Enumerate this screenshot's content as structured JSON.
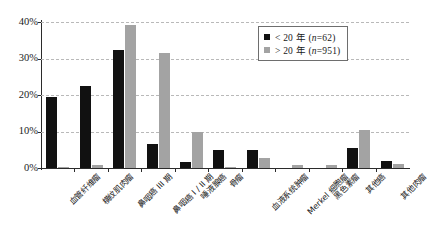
{
  "chart_data": {
    "type": "bar",
    "title": "",
    "subtitle": "",
    "xlabel": "",
    "ylabel": "",
    "ylim": [
      0,
      40
    ],
    "yticks": [
      0,
      10,
      20,
      30,
      40
    ],
    "ytick_labels": [
      "0%",
      "10%",
      "20%",
      "30%",
      "40%"
    ],
    "grid": true,
    "grid_style": "dashed horizontal",
    "legend_position": "top-right inside",
    "orientation": "vertical grouped",
    "categories": [
      "血管纤维瘤",
      "横纹肌肉瘤",
      "鼻咽癌 III 期",
      "鼻咽癌 I / II 期",
      "唾液腺癌",
      "骨瘤",
      "血液系统肿瘤",
      "Merkel 细胞瘤",
      "黑色素瘤",
      "其他癌",
      "其他肉瘤"
    ],
    "series": [
      {
        "name": "< 20 年 (n=62)",
        "color": "#111111",
        "values": [
          19.4,
          22.6,
          32.3,
          6.5,
          1.6,
          4.8,
          4.8,
          0.0,
          0.0,
          5.6,
          1.9
        ]
      },
      {
        "name": "> 20 年 (n=951)",
        "color": "#a3a3a3",
        "values": [
          0.3,
          0.7,
          39.2,
          31.4,
          9.8,
          0.2,
          2.8,
          0.8,
          0.8,
          10.3,
          1.0
        ]
      }
    ]
  },
  "legend": {
    "entries": [
      {
        "label_prefix": "< 20 年 (",
        "label_italic": "n",
        "label_suffix": "=62)",
        "full": "< 20 年 (n=62)",
        "swatch": "black-square"
      },
      {
        "label_prefix": "> 20 年 (",
        "label_italic": "n",
        "label_suffix": "=951)",
        "full": "> 20 年 (n=951)",
        "swatch": "gray-square"
      }
    ]
  },
  "colors": {
    "series_under20": "#111111",
    "series_over20": "#a3a3a3",
    "axis": "#2b2b2b",
    "grid": "#b9b9b9",
    "background": "#ffffff"
  }
}
